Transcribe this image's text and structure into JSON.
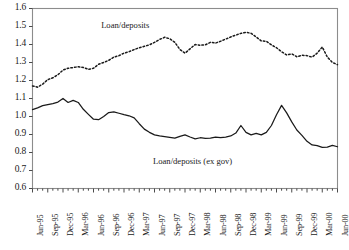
{
  "chart_data": {
    "type": "line",
    "title": "",
    "subtitle": "",
    "xlabel": "",
    "ylabel": "",
    "ylim": [
      0.6,
      1.6
    ],
    "ytick_values": [
      1.6,
      1.5,
      1.4,
      1.3,
      1.2,
      1.1,
      1.0,
      0.9,
      0.8,
      0.7,
      0.6
    ],
    "ytick_labels": [
      "1.6",
      "1.5",
      "1.4",
      "1.3",
      "1.2",
      "1.1",
      "1.0",
      "0.9",
      "0.8",
      "0.7",
      "0.6"
    ],
    "grid": false,
    "legend_position": "inline-annotations",
    "xtick_labels": [
      "Jun-95",
      "Sep-95",
      "Dec-95",
      "Mar-96",
      "Jun-96",
      "Sep-96",
      "Dec-96",
      "Mar-97",
      "Jun-97",
      "Sep-97",
      "Dec-97",
      "Mar-98",
      "Jun-98",
      "Sep-98",
      "Dec-98",
      "Mar-99",
      "Jun-99",
      "Sep-99",
      "Dec-99",
      "Mar-00",
      "Jun-00"
    ],
    "x_start": "Jun-95",
    "x_end": "Jun-00",
    "x_frequency": "monthly",
    "n_points": 61,
    "annotations": [
      {
        "text": "Loan/deposits",
        "x_frac": 0.225,
        "y_value": 1.505
      },
      {
        "text": "Loan/deposits (ex gov)",
        "x_frac": 0.395,
        "y_value": 0.745
      }
    ],
    "series": [
      {
        "name": "Loan/deposits",
        "style": "dotted",
        "color": "#1a1a1a",
        "values": [
          1.17,
          1.163,
          1.18,
          1.205,
          1.215,
          1.232,
          1.258,
          1.268,
          1.272,
          1.276,
          1.272,
          1.262,
          1.268,
          1.29,
          1.3,
          1.312,
          1.33,
          1.338,
          1.352,
          1.36,
          1.372,
          1.382,
          1.39,
          1.398,
          1.412,
          1.428,
          1.44,
          1.432,
          1.412,
          1.372,
          1.352,
          1.376,
          1.4,
          1.396,
          1.398,
          1.412,
          1.408,
          1.418,
          1.43,
          1.442,
          1.452,
          1.462,
          1.468,
          1.462,
          1.442,
          1.42,
          1.418,
          1.398,
          1.382,
          1.36,
          1.342,
          1.348,
          1.332,
          1.34,
          1.338,
          1.33,
          1.352,
          1.386,
          1.33,
          1.3,
          1.288
        ]
      },
      {
        "name": "Loan/deposits (ex gov)",
        "style": "solid",
        "color": "#1a1a1a",
        "values": [
          1.038,
          1.048,
          1.06,
          1.066,
          1.072,
          1.08,
          1.1,
          1.078,
          1.09,
          1.078,
          1.04,
          1.012,
          0.985,
          0.982,
          1.0,
          1.022,
          1.026,
          1.018,
          1.01,
          1.004,
          0.992,
          0.96,
          0.93,
          0.912,
          0.898,
          0.892,
          0.888,
          0.884,
          0.88,
          0.89,
          0.898,
          0.886,
          0.876,
          0.882,
          0.878,
          0.88,
          0.886,
          0.882,
          0.886,
          0.892,
          0.908,
          0.95,
          0.912,
          0.898,
          0.906,
          0.898,
          0.912,
          0.95,
          1.01,
          1.062,
          1.02,
          0.97,
          0.925,
          0.895,
          0.862,
          0.842,
          0.838,
          0.828,
          0.83,
          0.84,
          0.832
        ]
      }
    ]
  }
}
